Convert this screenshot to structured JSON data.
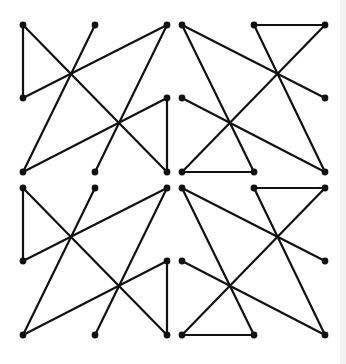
{
  "diagram": {
    "title": "",
    "stroke_color": "#111111",
    "node_color": "#111111",
    "background": "#ffffff",
    "stroke_width": 2.2,
    "node_radius": 3.4,
    "patterns": {
      "A": {
        "nodes": [
          [
            0,
            0
          ],
          [
            72,
            0
          ],
          [
            144,
            0
          ],
          [
            0,
            73
          ],
          [
            144,
            73
          ],
          [
            0,
            147
          ],
          [
            72,
            147
          ],
          [
            144,
            147
          ]
        ],
        "edges": [
          [
            0,
            7
          ],
          [
            0,
            3
          ],
          [
            3,
            2
          ],
          [
            2,
            6
          ],
          [
            1,
            5
          ],
          [
            5,
            4
          ],
          [
            4,
            7
          ]
        ]
      },
      "B": {
        "nodes": [
          [
            0,
            0
          ],
          [
            72,
            0
          ],
          [
            143,
            0
          ],
          [
            0,
            73
          ],
          [
            143,
            73
          ],
          [
            0,
            147
          ],
          [
            72,
            147
          ],
          [
            143,
            147
          ]
        ],
        "edges": [
          [
            0,
            4
          ],
          [
            0,
            6
          ],
          [
            1,
            2
          ],
          [
            1,
            7
          ],
          [
            2,
            5
          ],
          [
            5,
            6
          ],
          [
            3,
            7
          ]
        ]
      }
    },
    "tiles": [
      {
        "name": "top-left",
        "pattern": "A",
        "origin": [
          23,
          25
        ]
      },
      {
        "name": "top-right",
        "pattern": "B",
        "origin": [
          182,
          25
        ]
      },
      {
        "name": "bottom-left",
        "pattern": "A",
        "origin": [
          23,
          188
        ]
      },
      {
        "name": "bottom-right",
        "pattern": "B",
        "origin": [
          182,
          188
        ]
      }
    ]
  }
}
